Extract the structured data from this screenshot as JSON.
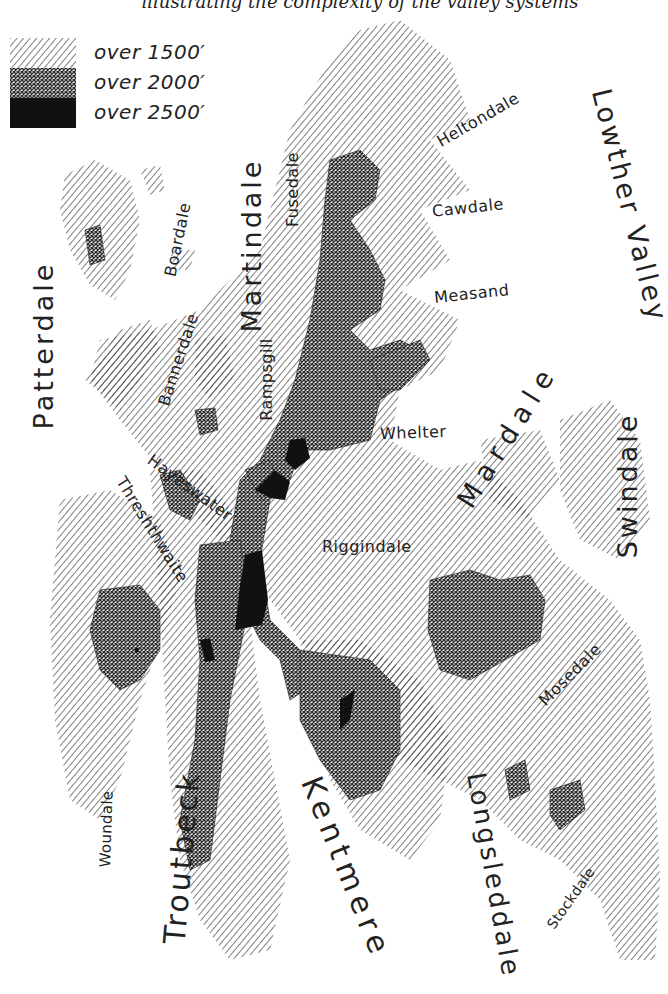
{
  "caption": "illustrating the complexity of the valley systems",
  "colors": {
    "ink": "#1a1a1a",
    "background": "#ffffff",
    "hatch": "#3a3a3a",
    "crosshatch": "#2a2a2a",
    "solid": "#111111"
  },
  "legend": {
    "items": [
      {
        "label": "over 1500′",
        "pattern": "diagonal-hatch"
      },
      {
        "label": "over 2000′",
        "pattern": "crosshatch"
      },
      {
        "label": "over 2500′",
        "pattern": "solid-black"
      }
    ]
  },
  "labels": {
    "major": [
      {
        "id": "patterdale",
        "text": "Patterdale"
      },
      {
        "id": "martindale",
        "text": "Martindale"
      },
      {
        "id": "lowther_valley",
        "text": "Lowther Valley"
      },
      {
        "id": "mardale",
        "text": "Mardale"
      },
      {
        "id": "swindale",
        "text": "Swindale"
      },
      {
        "id": "troutbeck",
        "text": "Troutbeck"
      },
      {
        "id": "kentmere",
        "text": "Kentmere"
      },
      {
        "id": "longsleddale",
        "text": "Longsleddale"
      }
    ],
    "minor": [
      {
        "id": "heltondale",
        "text": "Heltondale"
      },
      {
        "id": "cawdale",
        "text": "Cawdale"
      },
      {
        "id": "measand",
        "text": "Measand"
      },
      {
        "id": "fusedale",
        "text": "Fusedale"
      },
      {
        "id": "boardale",
        "text": "Boardale"
      },
      {
        "id": "bannerdale",
        "text": "Bannerdale"
      },
      {
        "id": "rampsgill",
        "text": "Rampsgill"
      },
      {
        "id": "whelter",
        "text": "Whelter"
      },
      {
        "id": "riggindale",
        "text": "Riggindale"
      },
      {
        "id": "hayeswater",
        "text": "Hayeswater"
      },
      {
        "id": "threshthwaite",
        "text": "Threshthwaite"
      },
      {
        "id": "mosedale",
        "text": "Mosedale"
      },
      {
        "id": "woundale",
        "text": "Woundale"
      },
      {
        "id": "stockdale",
        "text": "Stockdale"
      }
    ]
  }
}
